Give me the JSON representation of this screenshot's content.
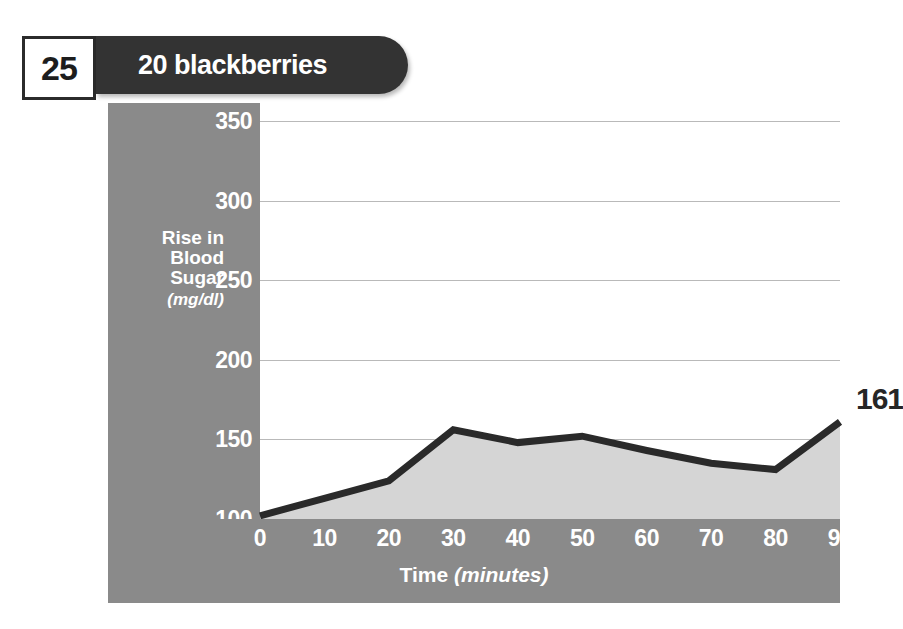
{
  "header": {
    "page_number": "25",
    "title": "20 blackberries",
    "pill_color": "#333333",
    "page_box_border": "#2b2b2b"
  },
  "chart_data": {
    "type": "area",
    "title": "20 blackberries",
    "xlabel": "Time",
    "xlabel_unit": "(minutes)",
    "ylabel": "Rise in Blood Sugar",
    "ylabel_unit": "(mg/dl)",
    "x": [
      0,
      10,
      20,
      30,
      40,
      50,
      60,
      70,
      80,
      90
    ],
    "values": [
      102,
      113,
      124,
      156,
      148,
      152,
      143,
      135,
      131,
      161
    ],
    "xticks": [
      "0",
      "10",
      "20",
      "30",
      "40",
      "50",
      "60",
      "70",
      "80",
      "90"
    ],
    "yticks": [
      "100",
      "150",
      "200",
      "250",
      "300",
      "350"
    ],
    "y_origin_tick": "0",
    "xlim": [
      0,
      90
    ],
    "ylim": [
      100,
      350
    ],
    "grid": true,
    "legend": "none",
    "annotations": [
      {
        "text": "161",
        "x": 90,
        "y": 161
      }
    ],
    "series_name": "Rise in Blood Sugar",
    "line_color": "#2a2a2a",
    "fill_color": "#d5d5d5",
    "panel_color": "#8a8a8a",
    "plot_bg": "#ffffff",
    "grid_color": "#b9b9b9"
  }
}
